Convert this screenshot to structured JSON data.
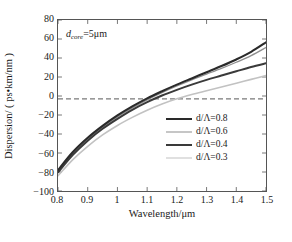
{
  "chart_data": {
    "type": "line",
    "title": "",
    "xlabel": "Wavelength/μm",
    "ylabel": "Dispersion/ ( ps•km/nm )",
    "xlim": [
      0.8,
      1.5
    ],
    "ylim": [
      -100,
      80
    ],
    "xticks": [
      0.8,
      0.9,
      1,
      1.1,
      1.2,
      1.3,
      1.4,
      1.5
    ],
    "xticklabels": [
      "0.8",
      "0.9",
      "1",
      "1.1",
      "1.2",
      "1.3",
      "1.4",
      "1.5"
    ],
    "yticks": [
      -100,
      -80,
      -60,
      -40,
      -20,
      0,
      20,
      40,
      60,
      80
    ],
    "yticklabels": [
      "−100",
      "−80",
      "−60",
      "−40",
      "−20",
      "0",
      "20",
      "40",
      "60",
      "80"
    ],
    "grid": false,
    "legend_position": "center-right",
    "annotations": [
      {
        "name": "core-diameter-annotation",
        "prefix": "d",
        "subscript": "core",
        "suffix": "=5μm",
        "x": 0.83,
        "y": 58
      }
    ],
    "reference_lines": [
      {
        "name": "zero-dispersion-line",
        "orientation": "horizontal",
        "value": -3,
        "style": "dashed",
        "color": "#7a7a7a"
      }
    ],
    "x": [
      0.8,
      0.85,
      0.9,
      0.95,
      1.0,
      1.05,
      1.1,
      1.15,
      1.2,
      1.25,
      1.3,
      1.35,
      1.4,
      1.45,
      1.5
    ],
    "series": [
      {
        "name": "d/Λ=0.8",
        "label": "d/Λ=0.8",
        "color": "#2a2a2a",
        "width": 2.1,
        "values": [
          -78.0,
          -59.0,
          -44.0,
          -31.5,
          -20.5,
          -11.0,
          -2.5,
          5.0,
          12.0,
          18.5,
          25.0,
          31.5,
          38.5,
          46.5,
          56.5
        ]
      },
      {
        "name": "d/Λ=0.6",
        "label": "d/Λ=0.6",
        "color": "#8e8e8e",
        "width": 1.3,
        "values": [
          -79.5,
          -60.5,
          -45.5,
          -33.0,
          -22.0,
          -12.5,
          -4.0,
          3.5,
          10.5,
          17.0,
          23.0,
          29.0,
          35.5,
          42.5,
          51.0
        ]
      },
      {
        "name": "d/Λ=0.4",
        "label": "d/Λ=0.4",
        "color": "#3a3a3a",
        "width": 2.0,
        "values": [
          -80.5,
          -62.0,
          -47.0,
          -34.5,
          -24.0,
          -14.5,
          -6.5,
          0.5,
          6.5,
          12.0,
          17.0,
          21.5,
          26.0,
          30.5,
          34.5
        ]
      },
      {
        "name": "d/Λ=0.3",
        "label": "d/Λ=0.3",
        "color": "#c2c2c2",
        "width": 1.6,
        "values": [
          -84.0,
          -67.0,
          -53.0,
          -41.0,
          -31.0,
          -22.5,
          -15.0,
          -8.5,
          -3.0,
          1.5,
          5.5,
          9.5,
          13.5,
          17.5,
          21.5
        ]
      }
    ]
  }
}
